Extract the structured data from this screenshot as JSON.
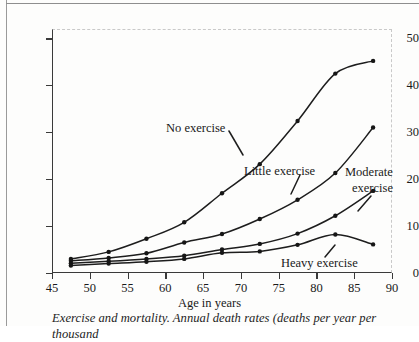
{
  "figure": {
    "y_axis_title": "Deaths per thousand per year",
    "x_axis_title": "Age in years",
    "caption": "Exercise and mortality. Annual death rates (deaths per year per thousand"
  },
  "annotations": {
    "no_exercise": "No exercise",
    "little_exercise": "Little exercise",
    "moderate_exercise_line1": "Moderate",
    "moderate_exercise_line2": "exercise",
    "heavy_exercise": "Heavy exercise"
  },
  "chart_data": {
    "type": "line",
    "title": "Exercise and mortality",
    "xlabel": "Age in years",
    "ylabel": "Deaths per thousand per year",
    "xlim": [
      45,
      90
    ],
    "ylim": [
      0,
      52
    ],
    "xticks": [
      45,
      50,
      55,
      60,
      65,
      70,
      75,
      80,
      85,
      90
    ],
    "yticks": [
      0,
      10,
      20,
      30,
      40,
      50
    ],
    "grid": false,
    "legend": "inline-annotations",
    "marker": "filled-circle",
    "x": [
      47.5,
      52.5,
      57.5,
      62.5,
      67.5,
      72.5,
      77.5,
      82.5,
      87.5
    ],
    "series": [
      {
        "name": "No exercise",
        "values": [
          3.0,
          4.5,
          7.3,
          10.8,
          17.0,
          23.2,
          32.4,
          42.5,
          45.2
        ]
      },
      {
        "name": "Little exercise",
        "values": [
          2.6,
          3.2,
          4.2,
          6.5,
          8.3,
          11.5,
          15.6,
          21.3,
          31.0
        ]
      },
      {
        "name": "Moderate exercise",
        "values": [
          2.1,
          2.5,
          3.0,
          3.7,
          5.0,
          6.2,
          8.4,
          12.2,
          17.5
        ]
      },
      {
        "name": "Heavy exercise",
        "values": [
          1.6,
          2.0,
          2.4,
          3.0,
          4.3,
          4.6,
          6.0,
          8.2,
          6.1
        ]
      }
    ]
  }
}
